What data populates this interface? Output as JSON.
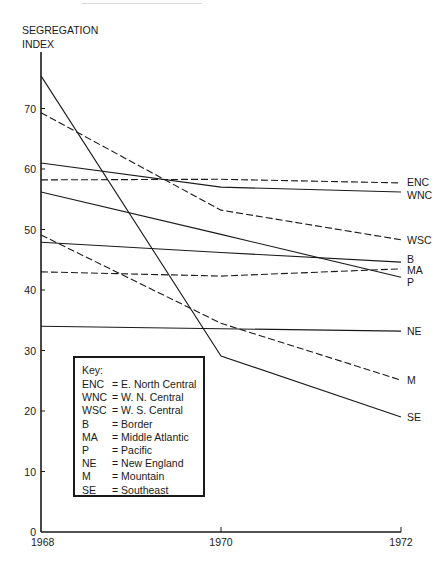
{
  "chart_data": {
    "type": "line",
    "title": "",
    "xlabel": "",
    "ylabel": "SEGREGATION INDEX",
    "x": [
      1968,
      1970,
      1972
    ],
    "x_ticks": [
      "1968",
      "1970",
      "1972"
    ],
    "y_ticks": [
      "0",
      "10",
      "20",
      "30",
      "40",
      "50",
      "60",
      "70"
    ],
    "ylim": [
      0,
      80
    ],
    "grid": false,
    "legend_position": "inside lower-left (Key box)",
    "series": [
      {
        "name": "ENC",
        "label": "E. North Central",
        "style": "dashed",
        "values": [
          58.2,
          58.3,
          57.7
        ]
      },
      {
        "name": "WNC",
        "label": "W. N. Central",
        "style": "solid",
        "values": [
          61.0,
          57.0,
          56.2
        ]
      },
      {
        "name": "WSC",
        "label": "W. S. Central",
        "style": "dashed",
        "values": [
          69.3,
          53.2,
          48.3
        ]
      },
      {
        "name": "B",
        "label": "Border",
        "style": "solid",
        "values": [
          47.9,
          46.2,
          44.6
        ]
      },
      {
        "name": "MA",
        "label": "Middle Atlantic",
        "style": "dashed",
        "values": [
          43.0,
          42.3,
          43.5
        ]
      },
      {
        "name": "P",
        "label": "Pacific",
        "style": "solid",
        "values": [
          56.2,
          49.2,
          42.1
        ]
      },
      {
        "name": "NE",
        "label": "New England",
        "style": "solid",
        "values": [
          34.0,
          33.6,
          33.2
        ]
      },
      {
        "name": "M",
        "label": "Mountain",
        "style": "dashed",
        "values": [
          49.1,
          34.5,
          25.1
        ]
      },
      {
        "name": "SE",
        "label": "Southeast",
        "style": "solid",
        "values": [
          75.4,
          29.1,
          19.0
        ]
      }
    ]
  },
  "axis": {
    "ylabel_line1": "SEGREGATION",
    "ylabel_line2": "INDEX"
  },
  "key": {
    "title": "Key:",
    "entries": [
      {
        "abbr": "ENC",
        "text": "= E. North Central"
      },
      {
        "abbr": "WNC",
        "text": "= W. N. Central"
      },
      {
        "abbr": "WSC",
        "text": "= W. S. Central"
      },
      {
        "abbr": "B",
        "text": "= Border"
      },
      {
        "abbr": "MA",
        "text": "= Middle Atlantic"
      },
      {
        "abbr": "P",
        "text": "= Pacific"
      },
      {
        "abbr": "NE",
        "text": "= New England"
      },
      {
        "abbr": "M",
        "text": "= Mountain"
      },
      {
        "abbr": "SE",
        "text": "= Southeast"
      }
    ]
  },
  "colors": {
    "ink": "#1a1a1a",
    "background": "#ffffff"
  }
}
